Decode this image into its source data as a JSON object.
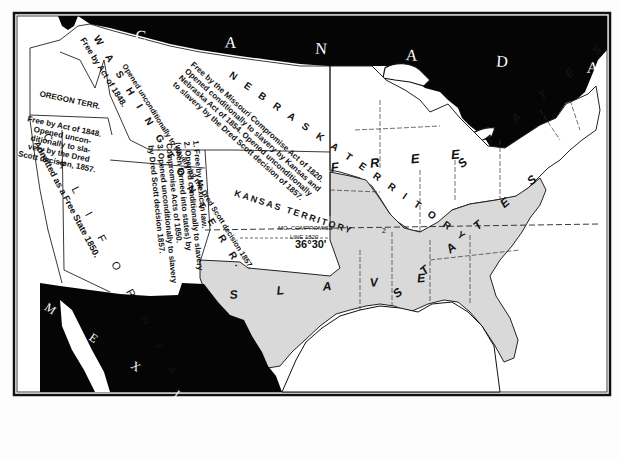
{
  "map": {
    "title": "Free and Slave States and Territories after the Dred Scott Decision, 1857",
    "colors": {
      "background": "#fdfdfd",
      "foreign_land": "#050505",
      "free_area": "#ffffff",
      "slave_area": "#d9d9d9",
      "border": "#1a1a1a"
    },
    "countries": {
      "canada": "C A N A D A",
      "mexico": "M E X I C O"
    },
    "regions": {
      "free_states": "F R E E   S T A T E S",
      "slave_states": "S L A V E   S T A T E S",
      "free_label": "F R E E",
      "slave_label": "S L A V E",
      "states_east_label": "S T A T E S",
      "states_south_label": "S T A T E S"
    },
    "territories": {
      "washington": {
        "name": "W A S H I N G T O N   T E R R.",
        "note_1": "Free by Act of 1848.",
        "note_2": "Opened unconditionally to slavery by the Dred Scott decision 1857."
      },
      "oregon": {
        "name": "OREGON TERR.",
        "note": "Free by Act of 1848.\nOpened uncon-\nditionally to sla-\nvery by the Dred\nScott decision, 1857."
      },
      "california": {
        "name": "C A L I F O R N I A",
        "note": "Admitted as a Free State 1850."
      },
      "utah_new_mexico": {
        "note": "1. Free by Mexican law.\n2. Opened conditionally to slavery\n(when formed into states) by\nCompromise Acts of 1850.\n3. Opened unconditionally to slavery\nby Dred Scott decision 1857."
      },
      "nebraska": {
        "name": "N E B R A S K A   T E R R I T O R Y",
        "note": "Free by the Missouri Compromise Act of 1820.\nOpened conditionally to slavery by Kansas and\nNebraska Act of 1854. Opened unconditionally\nto slavery by the Dred Scott decision of 1857."
      },
      "kansas": {
        "name": "KANSAS TERRITORY"
      }
    },
    "compromise_line": {
      "label_1": "MO. COMPROMISE",
      "label_2": "LINE 1820",
      "latitude": "36°30'"
    },
    "marker": "2"
  }
}
